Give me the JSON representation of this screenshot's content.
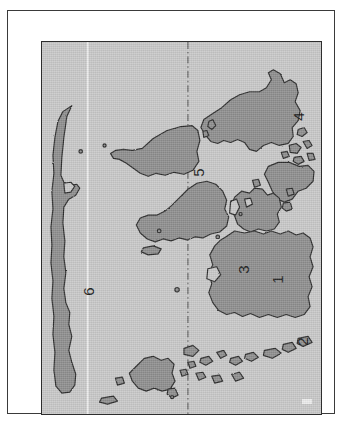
{
  "figure": {
    "kind": "map",
    "orientation": "labels rotated 90 degrees counter-clockwise",
    "colors": {
      "sea_fill": "#c9c9c9",
      "land_fill": "#8e8e8e",
      "coastline_stroke": "#2b2b2b",
      "frame_stroke": "#2e2e2e",
      "outer_frame_stroke": "#3a3a3a",
      "label_text": "#1a1a1a",
      "meridian_solid": "#f2f2f2",
      "meridian_dashdot": "#4a4a4a",
      "page_background": "#ffffff"
    }
  },
  "map": {
    "regions": [
      {
        "id": "region-1",
        "label": "1"
      },
      {
        "id": "region-2",
        "label": "2"
      },
      {
        "id": "region-3",
        "label": "3"
      },
      {
        "id": "region-4",
        "label": "4"
      },
      {
        "id": "region-5",
        "label": "5"
      },
      {
        "id": "region-6",
        "label": "6"
      },
      {
        "id": "region-7",
        "label": "7"
      }
    ],
    "gridlines": [
      {
        "id": "meridian-west",
        "style": "solid-light",
        "x_pct": 16
      },
      {
        "id": "meridian-center",
        "style": "dash-dot",
        "x_pct": 52
      }
    ]
  }
}
